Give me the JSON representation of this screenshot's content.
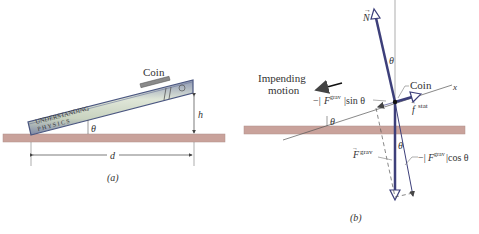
{
  "figure": {
    "panel_a": {
      "caption": "(a)",
      "coin_label": "Coin",
      "book_title_line1": "UNDERSTANDING",
      "book_title_line2": "P H Y S I C S",
      "angle_label": "θ",
      "height_label": "h",
      "distance_label": "d"
    },
    "panel_b": {
      "caption": "(b)",
      "coin_label": "Coin",
      "impending_motion_line1": "Impending",
      "impending_motion_line2": "motion",
      "normal_label": "N",
      "friction_label": "f",
      "friction_sup": "stat",
      "gravity_label": "F",
      "gravity_sup": "grav",
      "sin_component_prefix": "−|",
      "sin_component_suffix": "|sin θ",
      "cos_component_prefix": "−|",
      "cos_component_suffix": "|cos θ",
      "x_axis_label": "x",
      "angle_label_top": "θ",
      "angle_label_incline": "θ",
      "angle_label_bottom": "θ"
    },
    "colors": {
      "ground": "#c9a29b",
      "ground_edge": "#a8837c",
      "vector": "#3d3f7a",
      "book_body": "#b8c3d6",
      "book_edge": "#4a5680",
      "line": "#555555"
    }
  }
}
